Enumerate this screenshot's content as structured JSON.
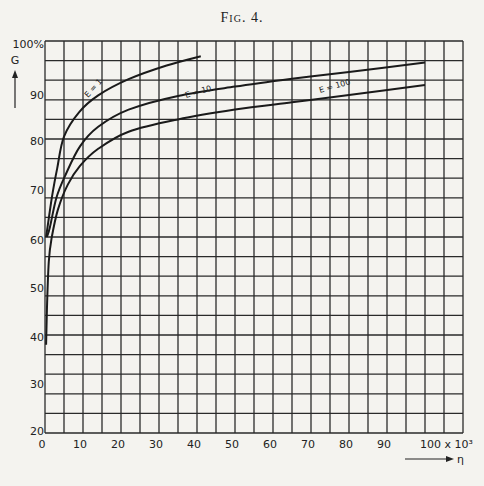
{
  "title": "Fig. 4.",
  "chart_data": {
    "type": "line",
    "title": "Fig. 4.",
    "xlabel": "η",
    "ylabel": "G",
    "x_unit_label": "100 x 10³",
    "y_top_label": "100%",
    "xlim": [
      0,
      110
    ],
    "ylim": [
      20,
      100
    ],
    "x_ticks": [
      0,
      10,
      20,
      30,
      40,
      50,
      60,
      70,
      80,
      90,
      100
    ],
    "x_tick_labels": [
      "0",
      "10",
      "20",
      "30",
      "40",
      "50",
      "60",
      "70",
      "80",
      "90",
      "100 x 10³"
    ],
    "y_ticks": [
      20,
      30,
      40,
      50,
      60,
      70,
      80,
      90,
      100
    ],
    "y_tick_labels": [
      "20",
      "30",
      "40",
      "50",
      "60",
      "70",
      "80",
      "90",
      "100%"
    ],
    "grid": true,
    "legend": "inline labels on curves",
    "series": [
      {
        "name": "E = 1",
        "x": [
          0.3,
          1.8,
          3.2,
          5,
          9,
          14,
          22,
          32,
          41
        ],
        "y": [
          60,
          68,
          74,
          80.5,
          85.5,
          88.9,
          92.2,
          95,
          96.9
        ]
      },
      {
        "name": "E = 10",
        "x": [
          0.5,
          1.3,
          3,
          5.3,
          9.2,
          14,
          22,
          35,
          50,
          65,
          80,
          100
        ],
        "y": [
          60,
          62,
          68,
          72.5,
          78.5,
          82.5,
          86,
          88.8,
          90.7,
          92.3,
          93.7,
          95.6
        ]
      },
      {
        "name": "E = 100",
        "x": [
          0.3,
          0.5,
          1,
          1.8,
          3.4,
          6,
          9.2,
          14,
          22,
          35,
          50,
          65,
          80,
          100
        ],
        "y": [
          38,
          45,
          55,
          60,
          65.6,
          70.7,
          74.5,
          78,
          81.5,
          84,
          86,
          87.5,
          89,
          91
        ]
      }
    ]
  },
  "axis": {
    "g_label": "G",
    "eta_label": "η"
  }
}
